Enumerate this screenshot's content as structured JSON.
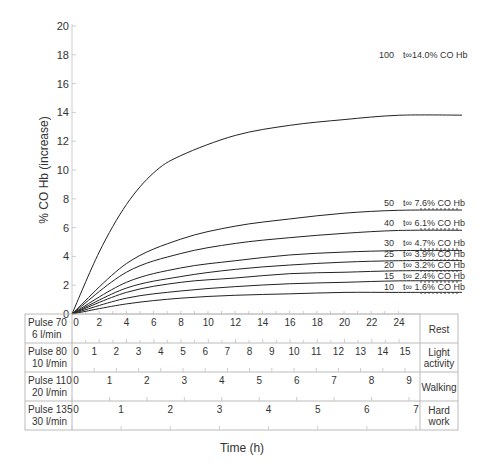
{
  "chart_data": {
    "type": "line",
    "title": "",
    "xlabel": "Time (h)",
    "ylabel": "% CO Hb (increase)",
    "ylim": [
      0,
      20
    ],
    "yticks": [
      0,
      2,
      4,
      6,
      8,
      10,
      12,
      14,
      16,
      18,
      20
    ],
    "xlim": [
      0,
      24
    ],
    "grid": false,
    "series": [
      {
        "name": "100",
        "equilibrium": "t∞14.0% CO Hb",
        "asymptote": 14.0,
        "points": [
          [
            0,
            0
          ],
          [
            2,
            4.3
          ],
          [
            4,
            7.6
          ],
          [
            6,
            9.8
          ],
          [
            8,
            11.0
          ],
          [
            12,
            12.4
          ],
          [
            16,
            13.1
          ],
          [
            20,
            13.5
          ],
          [
            24,
            13.8
          ]
        ]
      },
      {
        "name": "50",
        "equilibrium": "t∞ 7.6% CO Hb",
        "asymptote": 7.6,
        "points": [
          [
            0,
            0
          ],
          [
            4,
            3.5
          ],
          [
            8,
            5.2
          ],
          [
            12,
            6.1
          ],
          [
            16,
            6.6
          ],
          [
            20,
            7.0
          ],
          [
            24,
            7.2
          ]
        ]
      },
      {
        "name": "40",
        "equilibrium": "t∞ 6.1% CO Hb",
        "asymptote": 6.1,
        "points": [
          [
            0,
            0
          ],
          [
            4,
            2.9
          ],
          [
            8,
            4.2
          ],
          [
            12,
            4.9
          ],
          [
            16,
            5.3
          ],
          [
            20,
            5.6
          ],
          [
            24,
            5.8
          ]
        ]
      },
      {
        "name": "30",
        "equilibrium": "t∞ 4.7% CO Hb",
        "asymptote": 4.7,
        "points": [
          [
            0,
            0
          ],
          [
            4,
            2.2
          ],
          [
            8,
            3.2
          ],
          [
            12,
            3.7
          ],
          [
            16,
            4.1
          ],
          [
            20,
            4.3
          ],
          [
            24,
            4.4
          ]
        ]
      },
      {
        "name": "25",
        "equilibrium": "t∞ 3.9% CO Hb",
        "asymptote": 3.9,
        "points": [
          [
            0,
            0
          ],
          [
            4,
            1.8
          ],
          [
            8,
            2.6
          ],
          [
            12,
            3.1
          ],
          [
            16,
            3.4
          ],
          [
            20,
            3.6
          ],
          [
            24,
            3.7
          ]
        ]
      },
      {
        "name": "20",
        "equilibrium": "t∞ 3.2% CO Hb",
        "asymptote": 3.2,
        "points": [
          [
            0,
            0
          ],
          [
            4,
            1.5
          ],
          [
            8,
            2.2
          ],
          [
            12,
            2.5
          ],
          [
            16,
            2.8
          ],
          [
            20,
            2.9
          ],
          [
            24,
            3.0
          ]
        ]
      },
      {
        "name": "15",
        "equilibrium": "t∞ 2.4% CO Hb",
        "asymptote": 2.4,
        "points": [
          [
            0,
            0
          ],
          [
            4,
            1.1
          ],
          [
            8,
            1.6
          ],
          [
            12,
            1.9
          ],
          [
            16,
            2.1
          ],
          [
            20,
            2.2
          ],
          [
            24,
            2.3
          ]
        ]
      },
      {
        "name": "10",
        "equilibrium": "t∞ 1.6% CO Hb",
        "asymptote": 1.6,
        "points": [
          [
            0,
            0
          ],
          [
            4,
            0.7
          ],
          [
            8,
            1.1
          ],
          [
            12,
            1.3
          ],
          [
            16,
            1.4
          ],
          [
            20,
            1.5
          ],
          [
            24,
            1.5
          ]
        ]
      }
    ],
    "activity_table": [
      {
        "pulse": "Pulse 70",
        "ventilation": "6 l/min",
        "activity": "Rest",
        "max": 24,
        "labels": [
          0,
          2,
          4,
          6,
          8,
          10,
          12,
          14,
          16,
          18,
          20,
          22,
          24
        ],
        "step": 2
      },
      {
        "pulse": "Pulse 80",
        "ventilation": "10 l/min",
        "activity": "Light activity",
        "max": 15,
        "labels": [
          0,
          1,
          2,
          3,
          4,
          5,
          6,
          7,
          8,
          9,
          10,
          11,
          12,
          13,
          14,
          15
        ],
        "step": 1
      },
      {
        "pulse": "Pulse 110",
        "ventilation": "20 l/min",
        "activity": "Walking",
        "max": 9,
        "labels": [
          0,
          1,
          2,
          3,
          4,
          5,
          6,
          7,
          8,
          9
        ],
        "step": 1
      },
      {
        "pulse": "Pulse 135",
        "ventilation": "30 l/min",
        "activity": "Hard work",
        "max": 7,
        "labels": [
          0,
          1,
          2,
          3,
          4,
          5,
          6,
          7
        ],
        "step": 1
      }
    ],
    "legend_position": "inline-right"
  },
  "labels": {
    "ylabel": "% CO Hb (increase)",
    "xlabel": "Time (h)",
    "row0_pulse": "Pulse 70",
    "row0_vent": "6 l/min",
    "row0_act": "Rest",
    "row1_pulse": "Pulse 80",
    "row1_vent": "10 l/min",
    "row1_act1": "Light",
    "row1_act2": "activity",
    "row2_pulse": "Pulse 110",
    "row2_vent": "20 l/min",
    "row2_act": "Walking",
    "row3_pulse": "Pulse 135",
    "row3_vent": "30 l/min",
    "row3_act1": "Hard",
    "row3_act2": "work"
  }
}
